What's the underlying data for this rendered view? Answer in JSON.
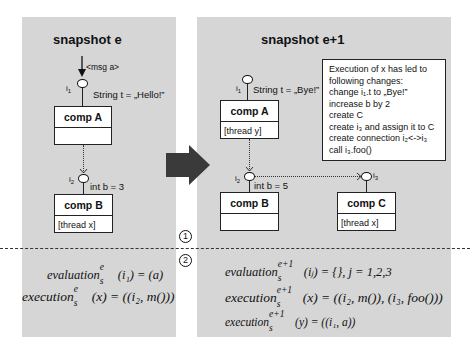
{
  "left_panel": {
    "title": "snapshot e",
    "message": "<msg a>",
    "comp_a": {
      "interface": "i",
      "interface_sub": "1",
      "attribute": "String t = „Hello!”",
      "name": "comp A",
      "body": ""
    },
    "comp_b": {
      "interface": "i",
      "interface_sub": "2",
      "attribute": "int b = 3",
      "name": "comp B",
      "body": "[thread x]"
    }
  },
  "right_panel": {
    "title": "snapshot e+1",
    "comp_a": {
      "interface": "i",
      "interface_sub": "1",
      "attribute": "String t = „Bye!”",
      "name": "comp A",
      "body": "[thread y]"
    },
    "comp_b": {
      "interface": "i",
      "interface_sub": "2",
      "attribute": "int b = 5",
      "name": "comp B",
      "body": ""
    },
    "comp_c": {
      "interface": "i",
      "interface_sub": "3",
      "name": "comp C",
      "body": "[thread x]"
    },
    "note": {
      "lines": [
        "Execution of x has led  to",
        "following changes:",
        "change i₁.t to „Bye!”",
        "increase b by 2",
        "create C",
        "create i₃ and assign it to C",
        "create connection i₂<->i₃",
        "call i₃.foo()"
      ]
    }
  },
  "markers": {
    "one": "1",
    "two": "2"
  },
  "formulas": {
    "left": [
      {
        "fn": "evaluation",
        "sup": "e",
        "sub": "s",
        "rest": "(i₁) = (a)"
      },
      {
        "fn": "execution",
        "sup": "e",
        "sub": "s",
        "rest": "(x) = ((i₂, m()))"
      }
    ],
    "right": [
      {
        "fn": "evaluation",
        "sup": "e+1",
        "sub": "s",
        "rest": "(iⱼ) = {}, j = 1,2,3"
      },
      {
        "fn": "execution",
        "sup": "e+1",
        "sub": "s",
        "rest": "(x) = ((i₂, m()), (i₃, foo()))"
      },
      {
        "fn": "execution",
        "sup": "e+1",
        "sub": "s",
        "rest": "(y) = ((i₁, a))"
      }
    ]
  },
  "colors": {
    "panel_bg": "#d6d6d6",
    "arrow": "#3a3a3a"
  }
}
